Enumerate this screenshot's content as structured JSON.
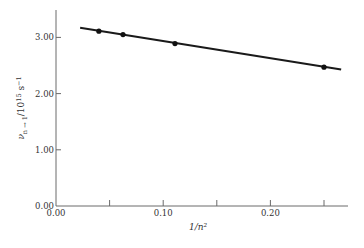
{
  "chart_data": {
    "type": "scatter",
    "title": "",
    "xlabel": "1/n²",
    "ylabel": "ν(n→1)/10^15 s^-1",
    "ylabel_parts": {
      "main": "ν",
      "sub": "n → 1",
      "rest": "/10",
      "sup": "15",
      "unit": " s",
      "unit_sup": "−1"
    },
    "xlim": [
      0.0,
      0.27
    ],
    "ylim": [
      0.0,
      3.5
    ],
    "x_ticks": [
      0.0,
      0.05,
      0.1,
      0.15,
      0.2,
      0.25
    ],
    "x_tick_labels": [
      {
        "value": 0.0,
        "label": "0.00"
      },
      {
        "value": 0.1,
        "label": "0.10"
      },
      {
        "value": 0.2,
        "label": "0.20"
      }
    ],
    "y_ticks": [
      0.0,
      1.0,
      2.0,
      3.0
    ],
    "y_tick_labels": [
      {
        "value": 0.0,
        "label": "0.00"
      },
      {
        "value": 1.0,
        "label": "1.00"
      },
      {
        "value": 2.0,
        "label": "2.00"
      },
      {
        "value": 3.0,
        "label": "3.00"
      }
    ],
    "grid": false,
    "legend": null,
    "series": [
      {
        "name": "measured",
        "kind": "points",
        "x": [
          0.04,
          0.0625,
          0.111,
          0.25
        ],
        "y": [
          3.11,
          3.05,
          2.89,
          2.47
        ]
      },
      {
        "name": "linear fit",
        "kind": "line",
        "x": [
          0.0225,
          0.266
        ],
        "y": [
          3.17,
          2.43
        ]
      }
    ]
  }
}
